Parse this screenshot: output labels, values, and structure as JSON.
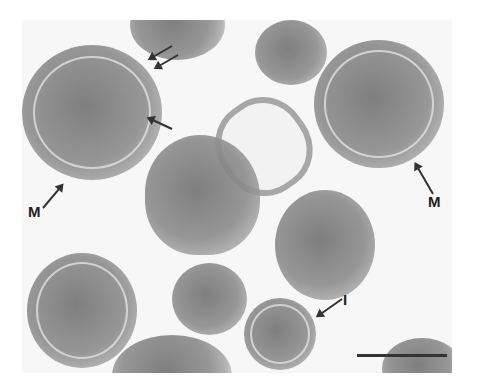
{
  "figure": {
    "type": "electron-micrograph",
    "labels": [
      {
        "id": "M1",
        "text": "M"
      },
      {
        "id": "M2",
        "text": "M"
      },
      {
        "id": "I",
        "text": "I"
      }
    ],
    "scale_bar": {
      "visible": true
    },
    "colors": {
      "background": "#f7f7f7",
      "cell": "#8c8c8c",
      "label": "#222222"
    }
  }
}
